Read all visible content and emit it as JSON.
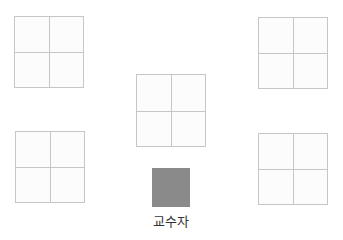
{
  "diagram": {
    "type": "classroom-seating-layout",
    "desks": [
      {
        "id": "desk-top-left",
        "x": 14,
        "y": 16,
        "w": 70,
        "h": 72
      },
      {
        "id": "desk-top-right",
        "x": 258,
        "y": 17,
        "w": 70,
        "h": 72
      },
      {
        "id": "desk-center",
        "x": 136,
        "y": 74,
        "w": 70,
        "h": 73
      },
      {
        "id": "desk-bottom-left",
        "x": 15,
        "y": 131,
        "w": 70,
        "h": 72
      },
      {
        "id": "desk-bottom-right",
        "x": 258,
        "y": 133,
        "w": 70,
        "h": 72
      }
    ],
    "instructor": {
      "label": "교수자",
      "color": "#8a8a8a"
    },
    "colors": {
      "desk_border": "#c6c6c6",
      "desk_fill": "#fcfcfc"
    }
  }
}
